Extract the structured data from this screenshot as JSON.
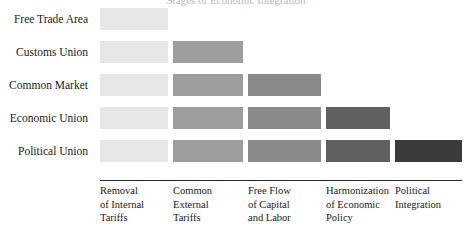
{
  "figure": {
    "title_sliver": "Stages of Economic Integration",
    "background": "#ffffff"
  },
  "chart_data": {
    "type": "bar",
    "title": "Stages of Economic Integration",
    "subtype": "cumulative-stacked-horizontal-staircase",
    "xlabel": "",
    "ylabel": "",
    "grid": false,
    "legend": "none",
    "categories": [
      "Free Trade Area",
      "Customs Union",
      "Common Market",
      "Economic Union",
      "Political Union"
    ],
    "features": [
      "Removal of Internal Tariffs",
      "Common External Tariffs",
      "Free Flow of Capital and Labor",
      "Harmonization of Economic Policy",
      "Political Integration"
    ],
    "feature_labels_wrapped": [
      [
        "Removal",
        "of Internal",
        "Tariffs"
      ],
      [
        "Common",
        "External",
        "Tariffs"
      ],
      [
        "Free Flow",
        "of Capital",
        "and Labor"
      ],
      [
        "Harmonization",
        "of Economic",
        "Policy"
      ],
      [
        "Political",
        "Integration"
      ]
    ],
    "feature_colors": [
      "#e6e6e6",
      "#9d9d9d",
      "#8a8a8a",
      "#606060",
      "#3b3b3b"
    ],
    "values": [
      1,
      2,
      3,
      4,
      5
    ],
    "series": [
      {
        "name": "Free Trade Area",
        "segments": 1,
        "values": [
          1,
          0,
          0,
          0,
          0
        ]
      },
      {
        "name": "Customs Union",
        "segments": 2,
        "values": [
          1,
          1,
          0,
          0,
          0
        ]
      },
      {
        "name": "Common Market",
        "segments": 3,
        "values": [
          1,
          1,
          1,
          0,
          0
        ]
      },
      {
        "name": "Economic Union",
        "segments": 4,
        "values": [
          1,
          1,
          1,
          1,
          0
        ]
      },
      {
        "name": "Political Union",
        "segments": 5,
        "values": [
          1,
          1,
          1,
          1,
          1
        ]
      }
    ],
    "xlim": [
      0,
      5
    ],
    "ylim": [
      0,
      5
    ]
  },
  "rows": [
    {
      "label": "Free Trade Area",
      "top": 0,
      "segments": 1
    },
    {
      "label": "Customs Union",
      "top": 33,
      "segments": 2
    },
    {
      "label": "Common Market",
      "top": 66,
      "segments": 3
    },
    {
      "label": "Economic Union",
      "top": 99,
      "segments": 4
    },
    {
      "label": "Political Union",
      "top": 132,
      "segments": 5
    }
  ],
  "columns": [
    {
      "left": 0,
      "width": 68,
      "label_left": 0,
      "lines": [
        "Removal",
        "of Internal",
        "Tariffs"
      ]
    },
    {
      "left": 73,
      "width": 70,
      "label_left": 73,
      "lines": [
        "Common",
        "External",
        "Tariffs"
      ]
    },
    {
      "left": 148,
      "width": 73,
      "label_left": 148,
      "lines": [
        "Free Flow",
        "of Capital",
        "and Labor"
      ]
    },
    {
      "left": 226,
      "width": 64,
      "label_left": 226,
      "lines": [
        "Harmonization",
        "of Economic",
        "Policy"
      ]
    },
    {
      "left": 295,
      "width": 67,
      "label_left": 295,
      "lines": [
        "Political",
        "Integration"
      ]
    }
  ]
}
